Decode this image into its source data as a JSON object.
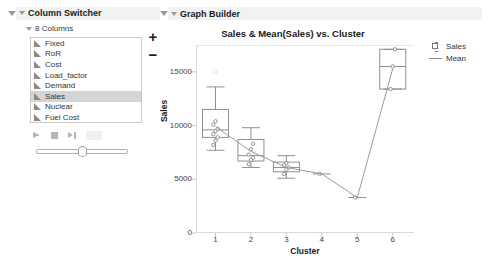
{
  "column_switcher": {
    "title": "Column Switcher",
    "subgroup_label": "8 Columns",
    "columns": [
      {
        "label": "Fixed",
        "selected": false
      },
      {
        "label": "RoR",
        "selected": false
      },
      {
        "label": "Cost",
        "selected": false
      },
      {
        "label": "Load_factor",
        "selected": false
      },
      {
        "label": "Demand",
        "selected": false
      },
      {
        "label": "Sales",
        "selected": true
      },
      {
        "label": "Nuclear",
        "selected": false
      },
      {
        "label": "Fuel Cost",
        "selected": false
      }
    ],
    "add_label": "+",
    "remove_label": "−",
    "controls": {
      "play": "play-button",
      "stop": "stop-button",
      "step": "step-button"
    }
  },
  "graph_builder": {
    "title": "Graph Builder"
  },
  "chart_data": {
    "type": "box",
    "title": "Sales & Mean(Sales) vs. Cluster",
    "xlabel": "Cluster",
    "ylabel": "Sales",
    "categories": [
      "1",
      "2",
      "3",
      "4",
      "5",
      "6"
    ],
    "xlim": [
      0.45,
      6.6
    ],
    "ylim": [
      0,
      17500
    ],
    "yticks": [
      0,
      5000,
      10000,
      15000
    ],
    "ytick_labels": [
      "0",
      "5000",
      "10000",
      "15000"
    ],
    "grid": false,
    "legend": {
      "position": "right",
      "entries": [
        {
          "label": "Sales",
          "key": "box"
        },
        {
          "label": "Mean",
          "key": "line"
        }
      ]
    },
    "series": [
      {
        "name": "Sales",
        "type": "box",
        "boxes": [
          {
            "category": "1",
            "min": 7700,
            "q1": 8900,
            "median": 9600,
            "q3": 11500,
            "max": 13600,
            "points": [
              8200,
              8600,
              8900,
              9200,
              9500,
              9700,
              10100,
              10400
            ],
            "outliers": [
              15000
            ]
          },
          {
            "category": "2",
            "min": 6100,
            "q1": 6700,
            "median": 7200,
            "q3": 8700,
            "max": 9800,
            "points": [
              6400,
              6800,
              7000,
              7300,
              7800,
              8300
            ],
            "outliers": []
          },
          {
            "category": "3",
            "min": 5100,
            "q1": 5700,
            "median": 6100,
            "q3": 6600,
            "max": 7200,
            "points": [
              5500,
              5900,
              6100,
              6300,
              6500
            ],
            "outliers": []
          },
          {
            "category": "4",
            "min": 5500,
            "q1": 5500,
            "median": 5500,
            "q3": 5500,
            "max": 5500,
            "points": [
              5500
            ],
            "outliers": []
          },
          {
            "category": "5",
            "min": 3300,
            "q1": 3300,
            "median": 3300,
            "q3": 3300,
            "max": 3300,
            "points": [
              3300
            ],
            "outliers": []
          },
          {
            "category": "6",
            "min": 13400,
            "q1": 13400,
            "median": 15500,
            "q3": 17100,
            "max": 17100,
            "points": [
              13400,
              15500,
              17100
            ],
            "outliers": []
          }
        ]
      },
      {
        "name": "Mean",
        "type": "line",
        "values": [
          9900,
          7600,
          6100,
          5500,
          3300,
          15300
        ]
      }
    ]
  }
}
